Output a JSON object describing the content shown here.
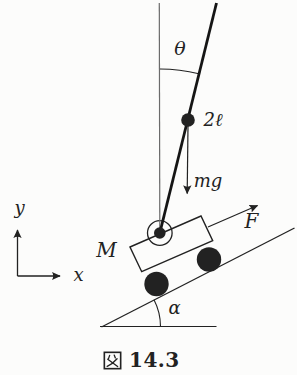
{
  "figure": {
    "type": "physics-diagram",
    "caption": {
      "figure_char": "図",
      "number": "14.3",
      "full": "図 14.3"
    },
    "labels": {
      "theta": "θ",
      "rod_length": "2ℓ",
      "gravity_force": "mg",
      "applied_force": "F",
      "cart_mass": "M",
      "incline_angle": "α",
      "axis_x": "x",
      "axis_y": "y"
    },
    "colors": {
      "background": "#fcfcfb",
      "ink": "#222222",
      "rod": "#151515",
      "reference_line": "#6b6b6b"
    }
  }
}
